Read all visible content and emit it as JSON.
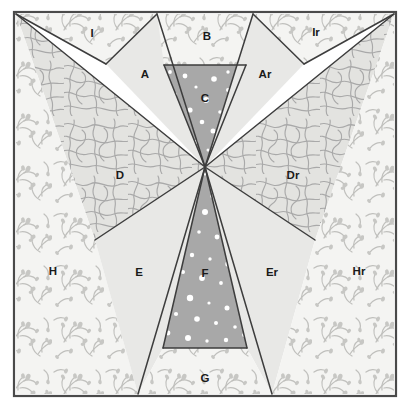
{
  "figure": {
    "name": "pinwheel-region-diagram",
    "type": "geometric-partition-diagram",
    "width": 411,
    "height": 410
  },
  "frame": {
    "x": 14,
    "y": 12,
    "width": 382,
    "height": 384,
    "border_color": "#4a4a4a",
    "border_width": 2.2
  },
  "center_point": {
    "x": 205,
    "y": 167
  },
  "palette": {
    "floral_fill": "#f4f4f2",
    "floral_stroke": "#b9b9b9",
    "contour_fill": "#e3e3e0",
    "contour_stroke": "#a9a9a9",
    "plain_fill": "#e8e8e6",
    "dotted_fill": "#a8a8a8",
    "dot_color": "#ffffff",
    "outline": "#3d3d3d",
    "label_color": "#1a1a1a"
  },
  "patterns": [
    {
      "key": "floral",
      "name": "floral-branch-pattern",
      "label": "floral / branching sprig hatch"
    },
    {
      "key": "contour",
      "name": "contour-maze-pattern",
      "label": "contour / maze wavy-line hatch"
    },
    {
      "key": "plain",
      "name": "plain-light-gray-fill",
      "label": "plain light gray"
    },
    {
      "key": "dotted",
      "name": "white-dot-on-gray-fill",
      "label": "white dots on medium gray"
    }
  ],
  "regions": [
    {
      "id": "I",
      "label": "I",
      "name": "region-i",
      "pattern": "floral",
      "label_x": 92,
      "label_y": 33,
      "points": "16,14 157,14 106,64"
    },
    {
      "id": "A",
      "label": "A",
      "name": "region-a",
      "pattern": "plain",
      "label_x": 145,
      "label_y": 74,
      "points": "157,14 205,167 106,64"
    },
    {
      "id": "B",
      "label": "B",
      "name": "region-b",
      "pattern": "floral",
      "label_x": 207,
      "label_y": 36,
      "points": "157,14 253,14 246,65 164,65"
    },
    {
      "id": "C",
      "label": "C",
      "name": "region-c",
      "pattern": "dotted",
      "label_x": 205,
      "label_y": 98,
      "points": "164,65 246,65 205,167"
    },
    {
      "id": "Ar",
      "label": "Ar",
      "name": "region-ar",
      "pattern": "plain",
      "label_x": 265,
      "label_y": 74,
      "points": "253,14 304,64 205,167"
    },
    {
      "id": "Ir",
      "label": "Ir",
      "name": "region-ir",
      "pattern": "floral",
      "label_x": 316,
      "label_y": 32,
      "points": "253,14 394,14 304,64"
    },
    {
      "id": "D",
      "label": "D",
      "name": "region-d",
      "pattern": "contour",
      "label_x": 120,
      "label_y": 175,
      "points": "16,14 205,167 95,240"
    },
    {
      "id": "Dr",
      "label": "Dr",
      "name": "region-dr",
      "pattern": "contour",
      "label_x": 293,
      "label_y": 175,
      "points": "394,14 315,240 205,167"
    },
    {
      "id": "H",
      "label": "H",
      "name": "region-h",
      "pattern": "floral",
      "label_x": 53,
      "label_y": 271,
      "points": "16,14 16,394 138,394 95,240"
    },
    {
      "id": "E",
      "label": "E",
      "name": "region-e",
      "pattern": "plain",
      "label_x": 139,
      "label_y": 272,
      "points": "95,240 205,167 163,348 138,394"
    },
    {
      "id": "F",
      "label": "F",
      "name": "region-f",
      "pattern": "dotted",
      "label_x": 205,
      "label_y": 273,
      "points": "205,167 247,348 163,348"
    },
    {
      "id": "Er",
      "label": "Er",
      "name": "region-er",
      "pattern": "plain",
      "label_x": 272,
      "label_y": 272,
      "points": "205,167 315,240 272,394 247,348"
    },
    {
      "id": "Hr",
      "label": "Hr",
      "name": "region-hr",
      "pattern": "floral",
      "label_x": 359,
      "label_y": 271,
      "points": "394,14 394,394 272,394 315,240"
    },
    {
      "id": "G",
      "label": "G",
      "name": "region-g",
      "pattern": "floral",
      "label_x": 205,
      "label_y": 378,
      "points": "163,348 247,348 272,394 138,394"
    }
  ],
  "separator_lines": [
    {
      "name": "line-center-to-top-left-corner",
      "x1": 205,
      "y1": 167,
      "x2": 16,
      "y2": 14
    },
    {
      "name": "line-center-to-top-right-corner",
      "x1": 205,
      "y1": 167,
      "x2": 394,
      "y2": 14
    },
    {
      "name": "line-center-to-a-apex",
      "x1": 205,
      "y1": 167,
      "x2": 157,
      "y2": 14
    },
    {
      "name": "line-center-to-ar-apex",
      "x1": 205,
      "y1": 167,
      "x2": 253,
      "y2": 14
    },
    {
      "name": "line-center-to-c-left",
      "x1": 205,
      "y1": 167,
      "x2": 164,
      "y2": 65
    },
    {
      "name": "line-center-to-c-right",
      "x1": 205,
      "y1": 167,
      "x2": 246,
      "y2": 65
    },
    {
      "name": "line-center-to-d-vertex",
      "x1": 205,
      "y1": 167,
      "x2": 95,
      "y2": 240
    },
    {
      "name": "line-center-to-dr-vertex",
      "x1": 205,
      "y1": 167,
      "x2": 315,
      "y2": 240
    },
    {
      "name": "line-center-to-e-bottom",
      "x1": 205,
      "y1": 167,
      "x2": 138,
      "y2": 394
    },
    {
      "name": "line-center-to-er-bottom",
      "x1": 205,
      "y1": 167,
      "x2": 272,
      "y2": 394
    },
    {
      "name": "line-center-to-f-left",
      "x1": 205,
      "y1": 167,
      "x2": 163,
      "y2": 348
    },
    {
      "name": "line-center-to-f-right",
      "x1": 205,
      "y1": 167,
      "x2": 247,
      "y2": 348
    },
    {
      "name": "line-i-a-boundary",
      "x1": 16,
      "y1": 14,
      "x2": 106,
      "y2": 64
    },
    {
      "name": "line-a-b-boundary",
      "x1": 106,
      "y1": 64,
      "x2": 157,
      "y2": 14
    },
    {
      "name": "line-ar-br-boundary",
      "x1": 253,
      "y1": 14,
      "x2": 304,
      "y2": 64
    },
    {
      "name": "line-ir-ar-boundary",
      "x1": 304,
      "y1": 64,
      "x2": 394,
      "y2": 14
    },
    {
      "name": "line-b-c-top-edge",
      "x1": 164,
      "y1": 65,
      "x2": 246,
      "y2": 65
    },
    {
      "name": "line-f-g-bottom-edge",
      "x1": 163,
      "y1": 348,
      "x2": 247,
      "y2": 348
    }
  ],
  "dots_c": [
    {
      "x": 185,
      "y": 76,
      "r": 2.4
    },
    {
      "x": 214,
      "y": 79,
      "r": 2.8
    },
    {
      "x": 196,
      "y": 87,
      "r": 1.6
    },
    {
      "x": 228,
      "y": 90,
      "r": 2.0
    },
    {
      "x": 175,
      "y": 95,
      "r": 2.2
    },
    {
      "x": 206,
      "y": 100,
      "r": 3.0
    },
    {
      "x": 190,
      "y": 110,
      "r": 2.6
    },
    {
      "x": 220,
      "y": 112,
      "r": 1.8
    },
    {
      "x": 202,
      "y": 122,
      "r": 2.3
    },
    {
      "x": 183,
      "y": 128,
      "r": 1.7
    },
    {
      "x": 213,
      "y": 131,
      "r": 2.5
    },
    {
      "x": 196,
      "y": 142,
      "r": 2.0
    },
    {
      "x": 208,
      "y": 150,
      "r": 1.5
    },
    {
      "x": 228,
      "y": 72,
      "r": 1.7
    },
    {
      "x": 170,
      "y": 72,
      "r": 1.9
    }
  ],
  "dots_f": [
    {
      "x": 197,
      "y": 185,
      "r": 2.0
    },
    {
      "x": 213,
      "y": 196,
      "r": 2.6
    },
    {
      "x": 189,
      "y": 203,
      "r": 1.6
    },
    {
      "x": 205,
      "y": 212,
      "r": 3.0
    },
    {
      "x": 223,
      "y": 215,
      "r": 2.2
    },
    {
      "x": 180,
      "y": 223,
      "r": 2.8
    },
    {
      "x": 199,
      "y": 232,
      "r": 1.8
    },
    {
      "x": 217,
      "y": 237,
      "r": 2.4
    },
    {
      "x": 234,
      "y": 243,
      "r": 2.0
    },
    {
      "x": 172,
      "y": 248,
      "r": 3.1
    },
    {
      "x": 192,
      "y": 255,
      "r": 2.2
    },
    {
      "x": 210,
      "y": 259,
      "r": 1.7
    },
    {
      "x": 228,
      "y": 264,
      "r": 2.7
    },
    {
      "x": 183,
      "y": 272,
      "r": 2.0
    },
    {
      "x": 202,
      "y": 278,
      "r": 2.9
    },
    {
      "x": 221,
      "y": 283,
      "r": 1.9
    },
    {
      "x": 239,
      "y": 288,
      "r": 2.3
    },
    {
      "x": 169,
      "y": 292,
      "r": 2.6
    },
    {
      "x": 190,
      "y": 298,
      "r": 3.2
    },
    {
      "x": 209,
      "y": 303,
      "r": 1.6
    },
    {
      "x": 227,
      "y": 308,
      "r": 2.5
    },
    {
      "x": 176,
      "y": 314,
      "r": 2.1
    },
    {
      "x": 197,
      "y": 319,
      "r": 2.8
    },
    {
      "x": 216,
      "y": 323,
      "r": 2.0
    },
    {
      "x": 235,
      "y": 327,
      "r": 1.8
    },
    {
      "x": 168,
      "y": 333,
      "r": 2.4
    },
    {
      "x": 188,
      "y": 338,
      "r": 3.0
    },
    {
      "x": 207,
      "y": 341,
      "r": 1.7
    },
    {
      "x": 226,
      "y": 340,
      "r": 2.2
    },
    {
      "x": 244,
      "y": 335,
      "r": 1.9
    },
    {
      "x": 205,
      "y": 174,
      "r": 1.5
    },
    {
      "x": 178,
      "y": 262,
      "r": 1.5
    },
    {
      "x": 249,
      "y": 320,
      "r": 1.6
    }
  ]
}
